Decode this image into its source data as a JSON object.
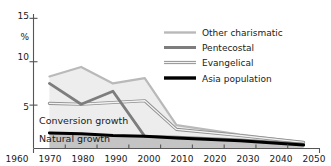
{
  "chart_data": {
    "type": "line",
    "title": "",
    "xlabel": "",
    "ylabel": "%",
    "xlim": [
      1960,
      2050
    ],
    "ylim": [
      0,
      15.5
    ],
    "grid": false,
    "legend_position": "top-right",
    "x_ticks": [
      1960,
      1970,
      1980,
      1990,
      2000,
      2010,
      2020,
      2030,
      2040,
      2050
    ],
    "y_ticks": [
      5,
      10,
      15
    ],
    "x": [
      1965,
      1975,
      1985,
      1995,
      2005,
      2025,
      2045
    ],
    "series": [
      {
        "name": "Other charismatic",
        "color": "#b9b9b9",
        "style": "solid-light",
        "values": [
          8.3,
          9.4,
          7.5,
          8.1,
          2.7,
          1.6,
          0.7
        ]
      },
      {
        "name": "Pentecostal",
        "color": "#7d7d7d",
        "style": "solid-medium",
        "values": [
          7.5,
          5.1,
          6.6,
          1.4,
          1.3,
          1.0,
          0.5
        ]
      },
      {
        "name": "Evangelical",
        "color": "#9a9a9a",
        "style": "double-outline",
        "values": [
          5.2,
          5.1,
          5.3,
          5.5,
          2.2,
          1.5,
          0.7
        ]
      },
      {
        "name": "Asia population",
        "color": "#000000",
        "style": "solid-thick-black",
        "values": [
          1.8,
          1.7,
          1.5,
          1.4,
          1.2,
          0.9,
          0.4
        ]
      }
    ],
    "bands": [
      {
        "label": "Conversion growth",
        "fill": "#ededed"
      },
      {
        "label": "Natural growth",
        "fill": "#c4c4c4"
      }
    ],
    "annotations": [
      {
        "text": "Conversion growth"
      },
      {
        "text": "Natural growth"
      }
    ]
  },
  "axis": {
    "unit_label": "%",
    "y_tick_labels": [
      "15",
      "10",
      "5"
    ],
    "x_tick_labels": [
      "1960",
      "1970",
      "1980",
      "1990",
      "2000",
      "2010",
      "2020",
      "2030",
      "2040",
      "2050"
    ]
  },
  "legend": {
    "items": [
      {
        "label": "Other charismatic"
      },
      {
        "label": "Pentecostal"
      },
      {
        "label": "Evangelical"
      },
      {
        "label": "Asia population"
      }
    ]
  },
  "colors": {
    "other_charismatic": "#b9b9b9",
    "pentecostal": "#7d7d7d",
    "evangelical": "#9a9a9a",
    "asia_population": "#000000",
    "conversion_band": "#ededed",
    "natural_band": "#c4c4c4",
    "axis": "#555555",
    "text": "#1a1a1a"
  }
}
